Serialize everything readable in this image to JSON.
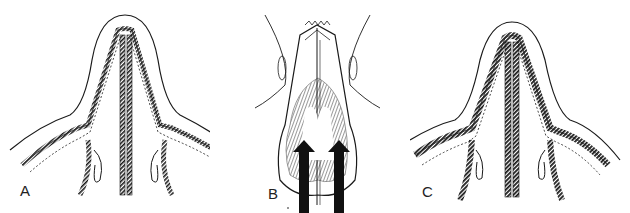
{
  "figure": {
    "panels": [
      {
        "id": "A",
        "label": "A",
        "description": "Cross-section of nose with straight septum between lateral walls"
      },
      {
        "id": "B",
        "label": "B",
        "description": "Inferior view of nose with two upward arrows indicating direction of force"
      },
      {
        "id": "C",
        "label": "C",
        "description": "Cross-section of nose with thickened walls and septum"
      }
    ],
    "colors": {
      "ink": "#1a1a1a",
      "background": "#ffffff",
      "arrow": "#111111"
    }
  }
}
